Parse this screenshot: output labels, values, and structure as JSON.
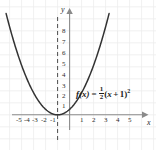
{
  "figure": {
    "axis_x_name": "x",
    "axis_y_name": "y",
    "equation": {
      "lhs": "f(x)",
      "equals": "=",
      "fraction_numerator": "1",
      "fraction_denominator": "2",
      "open_paren": "(",
      "var": "x",
      "plus": "+",
      "one": "1",
      "close_paren": ")",
      "exponent": "2",
      "plain": "f(x) = 1/2 (x + 1)^2"
    },
    "colors": {
      "curve": "#333333",
      "axis": "#7a7a7a",
      "grid": "#ececec",
      "text": "#2b2b2b",
      "background": "#ffffff",
      "dashed_line": "#4d4d4d"
    }
  },
  "chart_data": {
    "type": "line",
    "title": "",
    "xlabel": "x",
    "ylabel": "y",
    "grid": true,
    "legend": "none",
    "annotations": [
      {
        "text": "f(x) = 1/2 (x + 1)^2",
        "x": 1.4,
        "y": 2.2
      }
    ],
    "function": "f(x) = 0.5 * (x + 1)^2",
    "vertex": [
      -1,
      0
    ],
    "axis_of_symmetry": -1,
    "xlim": [
      -5.8,
      5.8
    ],
    "ylim": [
      -1.6,
      9.2
    ],
    "xticks": [
      -5,
      -4,
      -3,
      -2,
      -1,
      1,
      2,
      3,
      4,
      5
    ],
    "xtick_labels": [
      "-5",
      "-4",
      "-3",
      "-2",
      "-1",
      "1",
      "2",
      "3",
      "4",
      "5"
    ],
    "yticks": [
      1,
      2,
      3,
      4,
      5,
      6,
      7,
      8
    ],
    "ytick_labels": [
      "1",
      "2",
      "3",
      "4",
      "5",
      "6",
      "7",
      "8"
    ],
    "series": [
      {
        "name": "f(x) = 1/2 (x + 1)^2",
        "x": [
          -5.2,
          -5.0,
          -4.5,
          -4.0,
          -3.5,
          -3.0,
          -2.5,
          -2.0,
          -1.5,
          -1.0,
          -0.5,
          0.0,
          0.5,
          1.0,
          1.5,
          2.0,
          2.5,
          3.0,
          3.2
        ],
        "y": [
          8.82,
          8.0,
          6.125,
          4.5,
          3.125,
          2.0,
          1.125,
          0.5,
          0.125,
          0.0,
          0.125,
          0.5,
          1.125,
          2.0,
          3.125,
          4.5,
          6.125,
          8.0,
          8.82
        ]
      }
    ]
  }
}
